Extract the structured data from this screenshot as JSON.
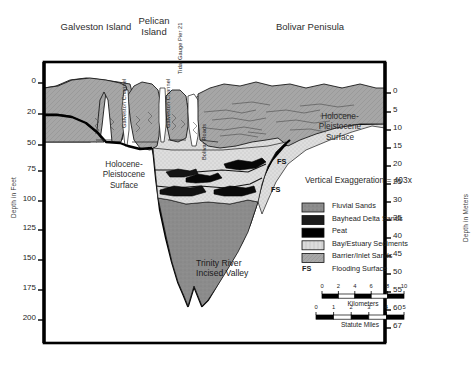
{
  "figure": {
    "type": "geologic-cross-section",
    "vertical_exaggeration": "Vertical Exaggeration = 403x"
  },
  "places": [
    {
      "label": "Galveston Island",
      "x": 48,
      "y": 22,
      "w": 96
    },
    {
      "label": "Pelican\nIsland",
      "x": 126,
      "y": 16,
      "w": 56
    },
    {
      "label": "Bolivar Penisula",
      "x": 250,
      "y": 22,
      "w": 120
    }
  ],
  "feature_labels": [
    {
      "label": "Galveston Channel",
      "x": 121,
      "y": 128
    },
    {
      "label": "Galveston Channel",
      "x": 165,
      "y": 128
    },
    {
      "label": "Tidal Gauge Pier 21",
      "x": 177,
      "y": 74
    },
    {
      "label": "Bolivar  Roads",
      "x": 201,
      "y": 160
    }
  ],
  "annotations": {
    "holocene_left": "Holocene-\nPleistocene\nSurface",
    "holocene_right": "Holocene-\nPleistocene\nSurface",
    "incised_valley": "Trinity River\nIncised Valley",
    "fs_markers": [
      "FS",
      "FS"
    ]
  },
  "axes": {
    "left": {
      "title": "Depth in Feet",
      "ticks": [
        {
          "label": "0",
          "y": 83
        },
        {
          "label": "20",
          "y": 114
        },
        {
          "label": "50",
          "y": 145
        },
        {
          "label": "75",
          "y": 171
        },
        {
          "label": "100",
          "y": 201
        },
        {
          "label": "125",
          "y": 230
        },
        {
          "label": "150",
          "y": 260
        },
        {
          "label": "175",
          "y": 290
        },
        {
          "label": "200",
          "y": 320
        }
      ]
    },
    "right": {
      "title": "Depth in Meters",
      "ticks": [
        {
          "label": "0",
          "y": 93
        },
        {
          "label": "5",
          "y": 112
        },
        {
          "label": "10",
          "y": 130
        },
        {
          "label": "15",
          "y": 148
        },
        {
          "label": "20",
          "y": 166
        },
        {
          "label": "25",
          "y": 184
        },
        {
          "label": "30",
          "y": 202
        },
        {
          "label": "35",
          "y": 220
        },
        {
          "label": "40",
          "y": 238
        },
        {
          "label": "45",
          "y": 256
        },
        {
          "label": "50",
          "y": 274
        },
        {
          "label": "55",
          "y": 292
        },
        {
          "label": "60",
          "y": 310
        },
        {
          "label": "67",
          "y": 328
        }
      ]
    }
  },
  "legend": {
    "items": [
      {
        "label": "Fluvial Sands",
        "swatch": "fluvial-sands",
        "color": "#8d8d8d"
      },
      {
        "label": "Bayhead Delta Sands",
        "swatch": "bayhead-delta-sands",
        "color": "#1c1c1c"
      },
      {
        "label": "Peat",
        "swatch": "peat",
        "color": "#000000"
      },
      {
        "label": "Bay/Estuary Sediments",
        "swatch": "bay-estuary-sediments",
        "color": "#d9d9d9"
      },
      {
        "label": "Barrier/Inlet Sands",
        "swatch": "barrier-inlet-sands",
        "color": "#a8a8a8"
      },
      {
        "label": "Flooding Surface",
        "swatch": "fs-text",
        "color": "#000000",
        "prefix": "FS"
      }
    ]
  },
  "scalebars": [
    {
      "unit_label": "Kilometers",
      "ticks": [
        "0",
        "2",
        "4",
        "6",
        "8",
        "10"
      ],
      "segments": 5
    },
    {
      "unit_label": "Statute Miles",
      "ticks": [
        "0",
        "1",
        "2",
        "3",
        "4",
        "5"
      ],
      "segments": 5
    }
  ],
  "colors": {
    "barrier_inlet_sands": "#a6a6a6",
    "bay_estuary_sediments": "#dcdcdc",
    "fluvial_sands": "#8c8c8c",
    "peat": "#050505",
    "bayhead_delta": "#1e1e1e",
    "frame": "#000000",
    "background": "#ffffff"
  }
}
